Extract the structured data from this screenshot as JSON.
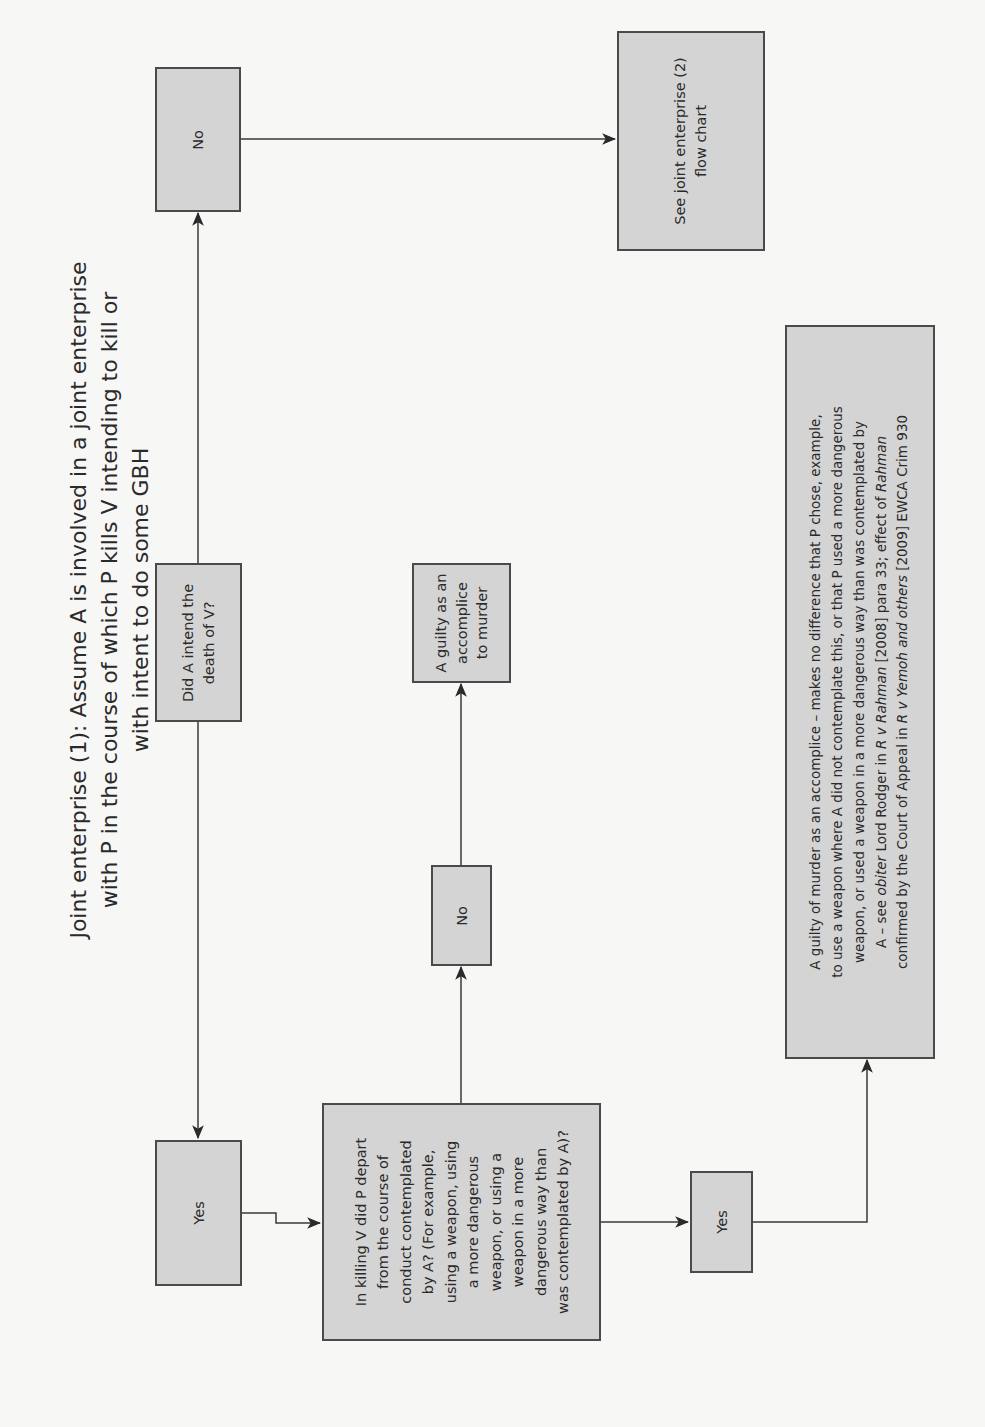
{
  "title": {
    "lines": [
      "Joint enterprise (1): Assume A is involved in a joint enterprise",
      "with P in the course of which P kills V intending to kill or",
      "with intent to do some GBH"
    ]
  },
  "nodes": {
    "q_intend_death": {
      "lines": [
        "Did A intend the",
        "death of V?"
      ]
    },
    "ans_no_top": {
      "label": "No"
    },
    "see_je2": {
      "lines": [
        "See joint enterprise (2)",
        "flow chart"
      ]
    },
    "ans_yes_left": {
      "label": "Yes"
    },
    "q_depart": {
      "lines": [
        "In killing V did P depart",
        "from the course of",
        "conduct contemplated",
        "by A? (For example,",
        "using a weapon, using",
        "a more dangerous",
        "weapon, or using a",
        "weapon in a more",
        "dangerous way than",
        "was contemplated by A)?"
      ]
    },
    "ans_no_mid": {
      "label": "No"
    },
    "result_accomplice": {
      "lines": [
        "A guilty as an",
        "accomplice",
        "to murder"
      ]
    },
    "ans_yes_right": {
      "label": "Yes"
    },
    "result_long": {
      "line1": "A guilty of murder as an accomplice – makes no difference that P chose, example,",
      "line2": "to use a weapon where A did not contemplate this, or that P used a more dangerous",
      "line3": "weapon, or used a weapon in a more dangerous way than was contemplated by",
      "line4_a": "A – see ",
      "line4_italic1": "obiter",
      "line4_b": " Lord Rodger in ",
      "line4_italic2": "R v Rahman",
      "line4_c": " [2008] para 33; effect of ",
      "line4_italic3": "Rahman",
      "line5_a": "confirmed by the Court of Appeal in ",
      "line5_italic": "R v Yemoh and others",
      "line5_b": " [2009] EWCA Crim 930"
    }
  },
  "edges": [
    {
      "from": "q_intend_death",
      "to": "ans_no_top"
    },
    {
      "from": "q_intend_death",
      "to": "ans_yes_left"
    },
    {
      "from": "ans_no_top",
      "to": "see_je2"
    },
    {
      "from": "ans_yes_left",
      "to": "q_depart"
    },
    {
      "from": "q_depart",
      "to": "ans_no_mid"
    },
    {
      "from": "ans_no_mid",
      "to": "result_accomplice"
    },
    {
      "from": "q_depart",
      "to": "ans_yes_right"
    },
    {
      "from": "ans_yes_right",
      "to": "result_long"
    }
  ],
  "colors": {
    "box_fill": "#d4d4d4",
    "box_border": "#4a4a4a",
    "line": "#3a3a3a",
    "background": "#f7f7f5"
  }
}
